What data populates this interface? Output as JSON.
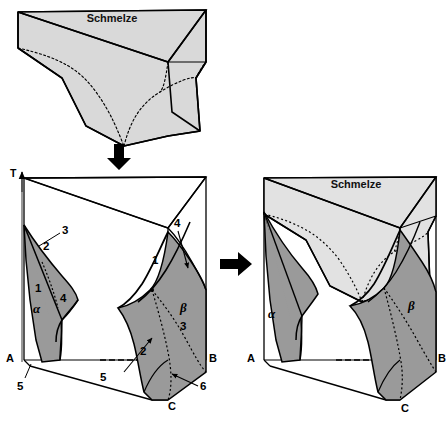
{
  "figure": {
    "title_text": "Schmelze",
    "colors": {
      "melt_fill": "#d9d9d9",
      "solid_fill": "#9a9a9a",
      "melt_fill_right": "#e2e2e2",
      "outline": "#000000",
      "background": "#ffffff"
    }
  },
  "top_panel": {
    "name": "melt-volume",
    "melt_label": "Schmelze"
  },
  "arrows": {
    "down_arrow": "arrow-down",
    "right_arrow": "arrow-right"
  },
  "left_panel": {
    "name": "solid-phase-prism",
    "axis_label": "T",
    "corner_labels": {
      "a": "A",
      "b": "B",
      "c": "C"
    },
    "alpha_label": "α",
    "beta_label": "β",
    "alpha_numbers": [
      "3",
      "2",
      "1",
      "4"
    ],
    "beta_numbers": [
      "4",
      "1",
      "3",
      "2"
    ],
    "leader_numbers": [
      "5",
      "5",
      "6"
    ],
    "all_surface_numbers": [
      "1",
      "2",
      "3",
      "4",
      "5",
      "6"
    ]
  },
  "right_panel": {
    "name": "combined-phase-diagram",
    "melt_label": "Schmelze",
    "corner_labels": {
      "a": "A",
      "b": "B",
      "c": "C"
    },
    "alpha_label": "α",
    "beta_label": "β"
  }
}
